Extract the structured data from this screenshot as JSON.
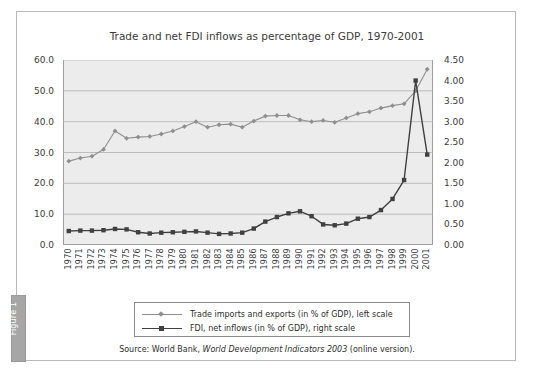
{
  "figure": {
    "tab_label": "Figure 1",
    "title": "Trade and net FDI inflows as percentage of GDP, 1970-2001",
    "source_prefix": "Source: World Bank, ",
    "source_italic": "World Development Indicators 2003",
    "source_suffix": " (online version)."
  },
  "colors": {
    "trade_series": "#8f8f8f",
    "fdi_series": "#404040",
    "plot_background": "#ececec",
    "gridline": "#b0b0b0",
    "axis": "#9e9e9e",
    "frame": "#b9b9b9",
    "tab_background": "#a6a6a6",
    "text": "#3b3b3b"
  },
  "legend": {
    "items": [
      {
        "label": "Trade imports and exports (in % of GDP), left scale",
        "marker": "diamond",
        "color": "#8f8f8f"
      },
      {
        "label": "FDI, net inflows (in % of GDP), right scale",
        "marker": "square",
        "color": "#404040"
      }
    ]
  },
  "chart_data": {
    "type": "line",
    "title": "Trade and net FDI inflows as percentage of GDP, 1970-2001",
    "xlabel": "",
    "ylabel": "",
    "grid": true,
    "legend_position": "bottom",
    "categories": [
      "1970",
      "1971",
      "1972",
      "1973",
      "1974",
      "1975",
      "1976",
      "1977",
      "1978",
      "1979",
      "1980",
      "1981",
      "1982",
      "1983",
      "1984",
      "1985",
      "1986",
      "1987",
      "1988",
      "1989",
      "1990",
      "1991",
      "1992",
      "1993",
      "1994",
      "1995",
      "1996",
      "1997",
      "1998",
      "1999",
      "2000",
      "2001"
    ],
    "axes": {
      "left": {
        "label": "Trade (% of GDP)",
        "ticks": [
          "0.0",
          "10.0",
          "20.0",
          "30.0",
          "40.0",
          "50.0",
          "60.0"
        ],
        "ylim": [
          0,
          60
        ]
      },
      "right": {
        "label": "FDI (% of GDP)",
        "ticks": [
          "0.00",
          "0.50",
          "1.00",
          "1.50",
          "2.00",
          "2.50",
          "3.00",
          "3.50",
          "4.00",
          "4.50"
        ],
        "ylim": [
          0,
          4.5
        ]
      }
    },
    "series": [
      {
        "name": "Trade imports and exports (in % of GDP), left scale",
        "axis": "left",
        "color": "#8f8f8f",
        "marker": "diamond",
        "values": [
          27.2,
          28.2,
          28.8,
          31.0,
          37.0,
          34.6,
          35.0,
          35.2,
          36.0,
          37.0,
          38.4,
          40.0,
          38.2,
          39.0,
          39.2,
          38.2,
          40.2,
          41.8,
          42.0,
          42.0,
          40.6,
          40.0,
          40.4,
          39.8,
          41.2,
          42.6,
          43.2,
          44.4,
          45.2,
          45.8,
          50.0,
          57.0
        ]
      },
      {
        "name": "FDI, net inflows (in % of GDP), right scale",
        "axis": "right",
        "color": "#404040",
        "marker": "square",
        "values": [
          0.34,
          0.35,
          0.35,
          0.36,
          0.39,
          0.38,
          0.31,
          0.28,
          0.3,
          0.31,
          0.32,
          0.33,
          0.3,
          0.27,
          0.28,
          0.3,
          0.4,
          0.57,
          0.68,
          0.77,
          0.82,
          0.7,
          0.5,
          0.48,
          0.52,
          0.64,
          0.68,
          0.85,
          1.12,
          1.58,
          4.0,
          2.2
        ]
      }
    ]
  }
}
